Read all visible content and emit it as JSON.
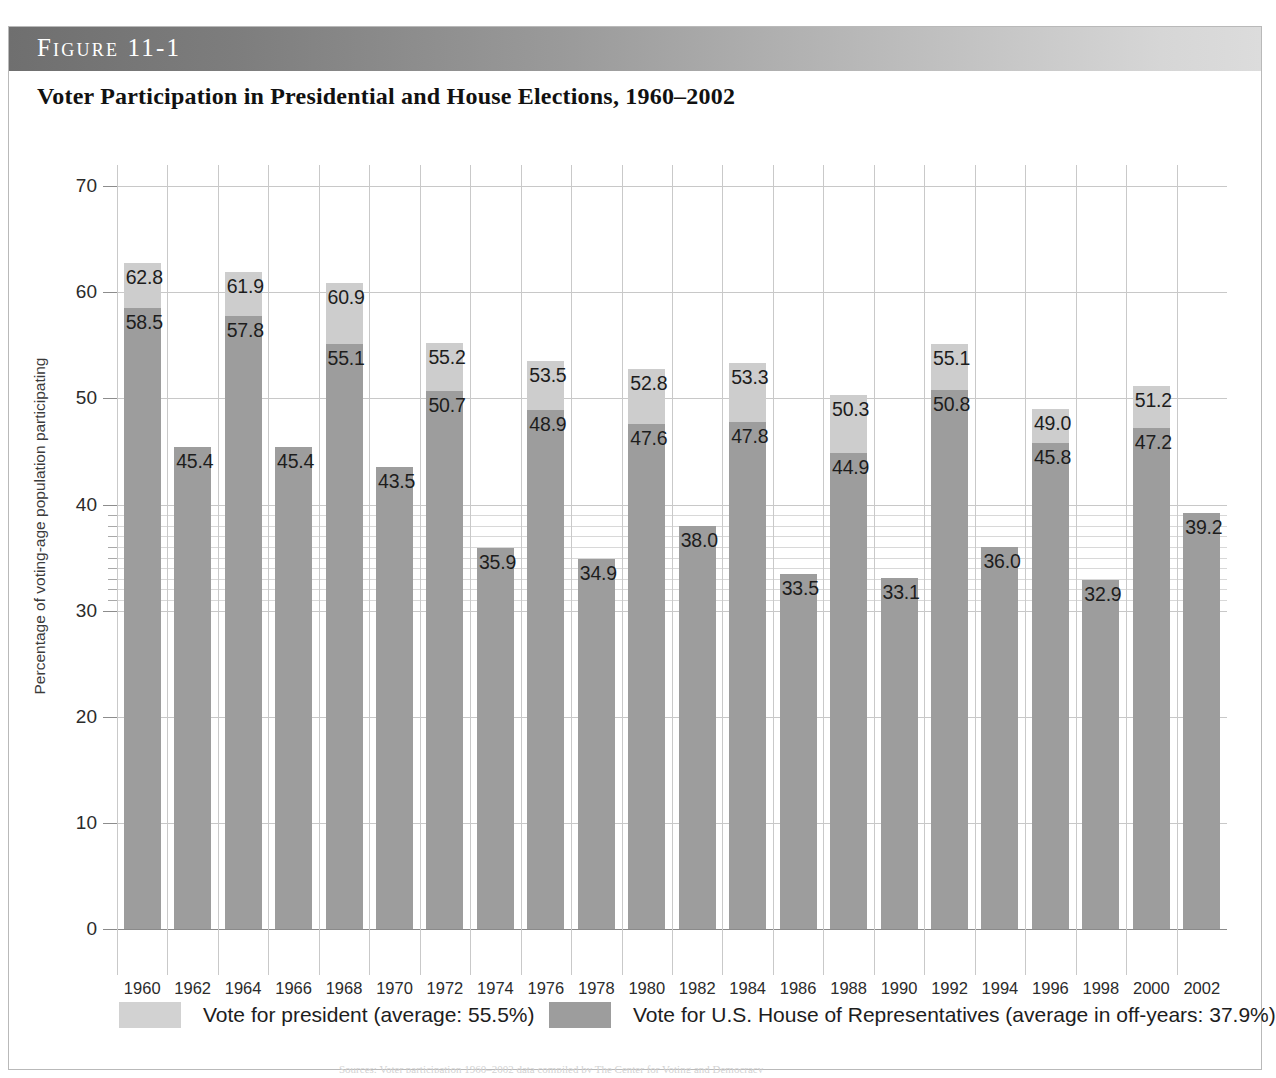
{
  "figure": {
    "label": "Figure 11-1",
    "title": "Voter Participation in Presidential and House Elections, 1960–2002",
    "source_note": "Sources: Voter participation 1960–2002 data compiled by The Center for Voting and Democracy"
  },
  "legend": {
    "president": "Vote for president (average: 55.5%)",
    "house": "Vote for U.S. House of Representatives (average in off-years: 37.9%)"
  },
  "colors": {
    "president": "#cdcdcd",
    "house": "#9d9d9d",
    "grid": "#c8c8c8",
    "header_dark": "#6f6f6f",
    "header_light": "#dcdcdc"
  },
  "chart_data": {
    "type": "bar",
    "title": "Voter Participation in Presidential and House Elections, 1960–2002",
    "xlabel": "",
    "ylabel": "Percentage of voting-age population participating",
    "ylim": [
      0,
      72
    ],
    "yticks": [
      0,
      10,
      20,
      30,
      40,
      50,
      60,
      70
    ],
    "minor_yticks": [
      31,
      32,
      33,
      34,
      35,
      36,
      37,
      38,
      39
    ],
    "grid": true,
    "legend_position": "bottom",
    "categories": [
      "1960",
      "1962",
      "1964",
      "1966",
      "1968",
      "1970",
      "1972",
      "1974",
      "1976",
      "1978",
      "1980",
      "1982",
      "1984",
      "1986",
      "1988",
      "1990",
      "1992",
      "1994",
      "1996",
      "1998",
      "2000",
      "2002"
    ],
    "series": [
      {
        "name": "Vote for president (average: 55.5%)",
        "color": "#cdcdcd",
        "values": [
          62.8,
          null,
          61.9,
          null,
          60.9,
          null,
          55.2,
          null,
          53.5,
          null,
          52.8,
          null,
          53.3,
          null,
          50.3,
          null,
          55.1,
          null,
          49.0,
          null,
          51.2,
          null
        ]
      },
      {
        "name": "Vote for U.S. House of Representatives (average in off-years: 37.9%)",
        "color": "#9d9d9d",
        "values": [
          58.5,
          45.4,
          57.8,
          45.4,
          55.1,
          43.5,
          50.7,
          35.9,
          48.9,
          34.9,
          47.6,
          38.0,
          47.8,
          33.5,
          44.9,
          33.1,
          50.8,
          36.0,
          45.8,
          32.9,
          47.2,
          39.2
        ]
      }
    ],
    "labels": {
      "president": [
        "62.8",
        "",
        "61.9",
        "",
        "60.9",
        "",
        "55.2",
        "",
        "53.5",
        "",
        "52.8",
        "",
        "53.3",
        "",
        "50.3",
        "",
        "55.1",
        "",
        "49.0",
        "",
        "51.2",
        ""
      ],
      "house": [
        "58.5",
        "45.4",
        "57.8",
        "45.4",
        "55.1",
        "43.5",
        "50.7",
        "35.9",
        "48.9",
        "34.9",
        "47.6",
        "38.0",
        "47.8",
        "33.5",
        "44.9",
        "33.1",
        "50.8",
        "36.0",
        "45.8",
        "32.9",
        "47.2",
        "39.2"
      ]
    },
    "averages": {
      "president": 55.5,
      "house_off_years": 37.9
    }
  }
}
